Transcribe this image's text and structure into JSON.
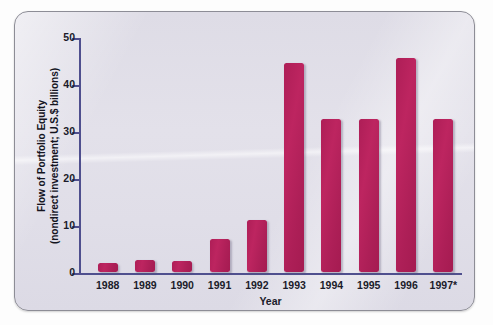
{
  "chart_data": {
    "type": "bar",
    "title": "",
    "xlabel": "Year",
    "ylabel": "Flow of Portfolio Equity (nondirect investment; U.S.$ billions)",
    "ylabel_line1": "Flow of Portfolio Equity",
    "ylabel_line2": "(nondirect investment; U.S.$ billions)",
    "categories": [
      "1988",
      "1989",
      "1990",
      "1991",
      "1992",
      "1993",
      "1994",
      "1995",
      "1996",
      "1997*"
    ],
    "values": [
      2,
      2.5,
      2.3,
      7,
      11,
      44.5,
      32.5,
      32.5,
      45.5,
      32.5
    ],
    "ylim": [
      0,
      50
    ],
    "yticks": [
      0,
      10,
      20,
      30,
      40,
      50
    ],
    "ytick_labels": [
      "0",
      "10",
      "20",
      "30",
      "40",
      "50"
    ],
    "grid": false,
    "legend": false,
    "bar_color": "#b5205a",
    "axis_color": "#4f4f8e",
    "panel_background": "#e0dee8"
  }
}
